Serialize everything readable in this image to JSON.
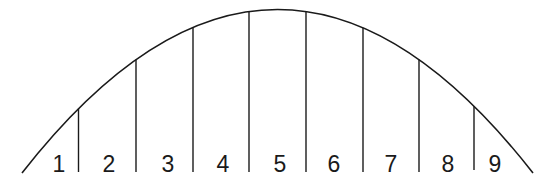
{
  "diagram": {
    "type": "parabola-strips",
    "colors": {
      "stroke": "#1a1a1a",
      "background": "#ffffff"
    },
    "curve": {
      "start": [
        22,
        173
      ],
      "peak": [
        277.5,
        9.5
      ],
      "end": [
        533,
        173
      ]
    },
    "dividers": [
      {
        "x": 78.5,
        "top": 105,
        "bottom": 172
      },
      {
        "x": 136,
        "top": 56,
        "bottom": 172
      },
      {
        "x": 193,
        "top": 25,
        "bottom": 172
      },
      {
        "x": 249,
        "top": 11,
        "bottom": 172
      },
      {
        "x": 306,
        "top": 12,
        "bottom": 172
      },
      {
        "x": 363,
        "top": 28,
        "bottom": 172
      },
      {
        "x": 419,
        "top": 59,
        "bottom": 172
      },
      {
        "x": 474,
        "top": 105,
        "bottom": 170
      }
    ],
    "strips": [
      {
        "label": "1",
        "x": 59
      },
      {
        "label": "2",
        "x": 109
      },
      {
        "label": "3",
        "x": 168
      },
      {
        "label": "4",
        "x": 223
      },
      {
        "label": "5",
        "x": 280
      },
      {
        "label": "6",
        "x": 334
      },
      {
        "label": "7",
        "x": 391
      },
      {
        "label": "8",
        "x": 448
      },
      {
        "label": "9",
        "x": 495
      }
    ],
    "label_baseline": 172
  }
}
